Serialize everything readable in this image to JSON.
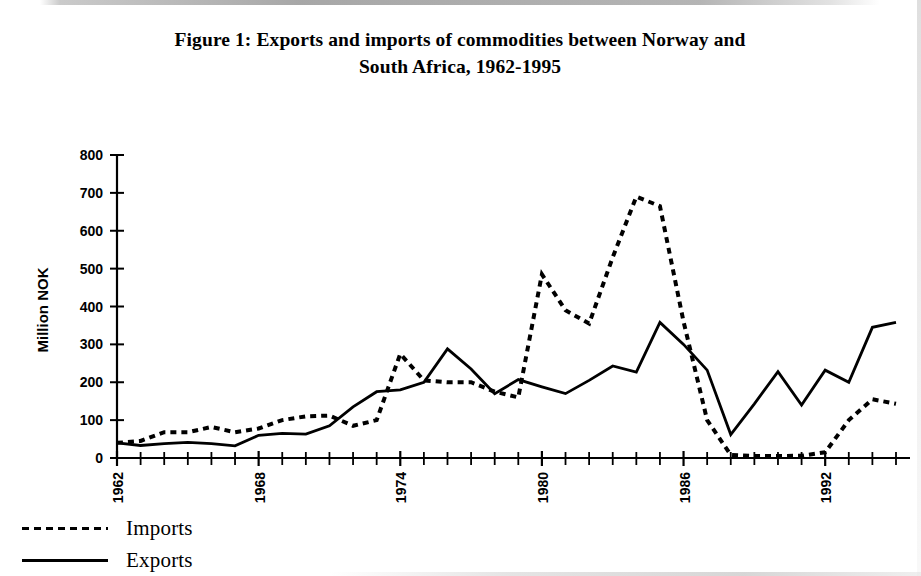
{
  "figure": {
    "title_line1": "Figure 1: Exports and imports of commodities between Norway and",
    "title_line2": "South Africa, 1962-1995"
  },
  "legend": {
    "items": [
      {
        "label": "Imports",
        "style": "dashed",
        "sample": "dashed-line-swatch"
      },
      {
        "label": "Exports",
        "style": "solid",
        "sample": "solid-line-swatch"
      }
    ]
  },
  "chart_data": {
    "type": "line",
    "title": "Figure 1: Exports and imports of commodities between Norway and South Africa, 1962-1995",
    "xlabel": "",
    "ylabel": "Million NOK",
    "xlim": [
      1962,
      1995
    ],
    "ylim": [
      0,
      800
    ],
    "ytick_step": 100,
    "yticks": [
      0,
      100,
      200,
      300,
      400,
      500,
      600,
      700,
      800
    ],
    "ytick_labels": [
      "0",
      "100",
      "200",
      "300",
      "400",
      "500",
      "600",
      "700",
      "800"
    ],
    "xticks_labeled": [
      1962,
      1968,
      1974,
      1980,
      1986,
      1992
    ],
    "xtick_labels": [
      "1962",
      "1968",
      "1974",
      "1980",
      "1986",
      "1992"
    ],
    "xtick_minor_every": 1,
    "grid": false,
    "legend_position": "below-left",
    "line_color": "#000000",
    "x": [
      1962,
      1963,
      1964,
      1965,
      1966,
      1967,
      1968,
      1969,
      1970,
      1971,
      1972,
      1973,
      1974,
      1975,
      1976,
      1977,
      1978,
      1979,
      1980,
      1981,
      1982,
      1983,
      1984,
      1985,
      1986,
      1987,
      1988,
      1989,
      1990,
      1991,
      1992,
      1993,
      1994,
      1995
    ],
    "series": [
      {
        "name": "Imports",
        "style": "dashed",
        "values": [
          40,
          45,
          68,
          68,
          82,
          68,
          78,
          100,
          110,
          112,
          85,
          100,
          275,
          205,
          200,
          200,
          175,
          160,
          485,
          390,
          355,
          530,
          690,
          665,
          360,
          100,
          8,
          5,
          5,
          6,
          15,
          100,
          155,
          143
        ]
      },
      {
        "name": "Exports",
        "style": "solid",
        "values": [
          40,
          33,
          38,
          41,
          38,
          32,
          60,
          65,
          63,
          85,
          135,
          175,
          180,
          200,
          288,
          235,
          170,
          207,
          188,
          170,
          205,
          243,
          227,
          358,
          300,
          232,
          62,
          143,
          228,
          140,
          232,
          200,
          345,
          358
        ]
      }
    ]
  },
  "axes": {
    "y_title": "Million NOK"
  }
}
